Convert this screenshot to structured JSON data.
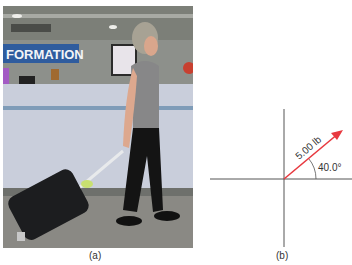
{
  "figure": {
    "panel_a": {
      "label": "(a)",
      "photo_sign_text": "FORMATION",
      "description": "Woman pulling a rolling suitcase by its handle at an information desk"
    },
    "panel_b": {
      "label": "(b)",
      "vector": {
        "magnitude_label": "5.00 lb",
        "angle_label": "40.0°",
        "angle_deg": 40.0,
        "color": "#e8393f"
      },
      "axis_color": "#555555"
    }
  }
}
